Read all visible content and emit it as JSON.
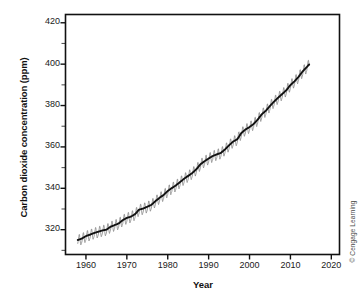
{
  "figure": {
    "credit": "© Cengage Learning",
    "background": "#ffffff"
  },
  "chart_data": {
    "type": "line",
    "title": "",
    "xlabel": "Year",
    "ylabel": "Carbon dioxide concentration (ppm)",
    "xlim": [
      1955,
      2022
    ],
    "ylim": [
      308,
      424
    ],
    "xticks": [
      1960,
      1970,
      1980,
      1990,
      2000,
      2010,
      2020
    ],
    "xtick_labels": [
      "1960",
      "1970",
      "1980",
      "1990",
      "2000",
      "2010",
      "2020"
    ],
    "yticks": [
      320,
      340,
      360,
      380,
      400,
      420
    ],
    "ytick_labels": [
      "320",
      "340",
      "360",
      "380",
      "400",
      "420"
    ],
    "y_minor_ticks": [
      310,
      330,
      350,
      370,
      390,
      410
    ],
    "grid": false,
    "legend": null,
    "axis_frame": "full-box",
    "series": [
      {
        "name": "Monthly mean CO2 (seasonal oscillation)",
        "color": "#8a8a8a",
        "description": "Sawtooth seasonal cycle of about 6 ppm peak-to-peak superimposed on the trend",
        "seasonal_amplitude_ppm": 3.0
      },
      {
        "name": "Annual mean CO2 trend",
        "color": "#111111",
        "x": [
          1958,
          1959,
          1960,
          1961,
          1962,
          1963,
          1964,
          1965,
          1966,
          1967,
          1968,
          1969,
          1970,
          1971,
          1972,
          1973,
          1974,
          1975,
          1976,
          1977,
          1978,
          1979,
          1980,
          1981,
          1982,
          1983,
          1984,
          1985,
          1986,
          1987,
          1988,
          1989,
          1990,
          1991,
          1992,
          1993,
          1994,
          1995,
          1996,
          1997,
          1998,
          1999,
          2000,
          2001,
          2002,
          2003,
          2004,
          2005,
          2006,
          2007,
          2008,
          2009,
          2010,
          2011,
          2012,
          2013,
          2014,
          2015
        ],
        "values": [
          315.0,
          315.7,
          316.9,
          317.6,
          318.4,
          319.0,
          319.6,
          320.0,
          321.4,
          322.2,
          323.0,
          324.6,
          325.7,
          326.3,
          327.5,
          329.7,
          330.2,
          331.1,
          332.0,
          333.8,
          335.4,
          336.8,
          338.7,
          340.1,
          341.4,
          343.0,
          344.6,
          346.0,
          347.4,
          349.2,
          351.6,
          353.1,
          354.4,
          355.6,
          356.4,
          357.1,
          358.8,
          360.8,
          362.6,
          363.7,
          366.7,
          368.4,
          369.6,
          371.1,
          373.2,
          375.8,
          377.5,
          379.8,
          381.9,
          383.8,
          385.6,
          387.4,
          389.9,
          391.7,
          393.9,
          396.5,
          398.6,
          400.8
        ]
      }
    ]
  }
}
